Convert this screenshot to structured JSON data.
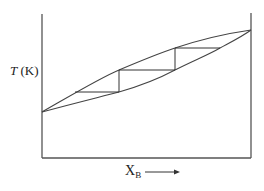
{
  "diagram": {
    "type": "phase-diagram",
    "y_axis": {
      "symbol": "T",
      "unit": "(K)"
    },
    "x_axis": {
      "symbol": "X",
      "subscript": "B",
      "arrow": "right-arrow"
    },
    "curves": [
      {
        "name": "vapour-curve",
        "position": "upper"
      },
      {
        "name": "liquid-curve",
        "position": "lower"
      }
    ],
    "steps": [
      {
        "tie_line_level": 1
      },
      {
        "tie_line_level": 2
      },
      {
        "tie_line_level": 3
      }
    ],
    "colors": {
      "line": "#444444",
      "background": "#ffffff"
    }
  }
}
